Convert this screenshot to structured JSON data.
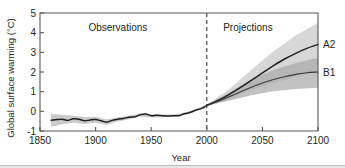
{
  "chart_data": {
    "type": "line",
    "title": "",
    "xlabel": "Year",
    "ylabel": "Global surface warming (°C)",
    "xlim": [
      1850,
      2100
    ],
    "ylim": [
      -1,
      5
    ],
    "xticks": [
      1850,
      1900,
      1950,
      2000,
      2050,
      2100
    ],
    "xtick_labels": [
      "1850",
      "1900",
      "1950",
      "2000",
      "2050",
      "2100"
    ],
    "yticks": [
      -1,
      0,
      1,
      2,
      3,
      4,
      5
    ],
    "ytick_labels": [
      "-1",
      "0",
      "1",
      "2",
      "3",
      "4",
      "5"
    ],
    "grid": false,
    "legend_position": "right-inline",
    "annotations": [
      {
        "text": "Observations",
        "x": 1920,
        "y": 4.1
      },
      {
        "text": "Projections",
        "x": 2037,
        "y": 4.1
      }
    ],
    "divider": {
      "x": 2000,
      "style": "dashed",
      "label": ""
    },
    "series": [
      {
        "name": "Observations",
        "color": "#231f20",
        "x": [
          1860,
          1865,
          1870,
          1875,
          1880,
          1885,
          1890,
          1895,
          1900,
          1905,
          1910,
          1915,
          1920,
          1925,
          1930,
          1935,
          1940,
          1945,
          1950,
          1955,
          1960,
          1965,
          1970,
          1975,
          1980,
          1985,
          1990,
          1995,
          2000
        ],
        "values": [
          -0.45,
          -0.42,
          -0.4,
          -0.46,
          -0.38,
          -0.4,
          -0.48,
          -0.44,
          -0.42,
          -0.48,
          -0.55,
          -0.46,
          -0.4,
          -0.36,
          -0.3,
          -0.28,
          -0.18,
          -0.14,
          -0.22,
          -0.2,
          -0.22,
          -0.24,
          -0.22,
          -0.22,
          -0.12,
          -0.06,
          0.06,
          0.14,
          0.3
        ]
      },
      {
        "name": "A2",
        "color": "#231f20",
        "x": [
          2000,
          2010,
          2020,
          2030,
          2040,
          2050,
          2060,
          2070,
          2080,
          2090,
          2100
        ],
        "values": [
          0.3,
          0.55,
          0.85,
          1.2,
          1.58,
          1.95,
          2.32,
          2.66,
          2.95,
          3.2,
          3.4
        ]
      },
      {
        "name": "B1",
        "color": "#3a3a3c",
        "x": [
          2000,
          2010,
          2020,
          2030,
          2040,
          2050,
          2060,
          2070,
          2080,
          2090,
          2100
        ],
        "values": [
          0.3,
          0.5,
          0.74,
          0.98,
          1.22,
          1.44,
          1.62,
          1.76,
          1.88,
          1.96,
          2.0
        ]
      }
    ],
    "bands": [
      {
        "name": "Observations uncertainty",
        "series": "Observations",
        "x": [
          1860,
          1870,
          1880,
          1890,
          1900,
          1910,
          1920,
          1930,
          1940,
          1950,
          1960,
          1970,
          1980,
          1990,
          2000
        ],
        "lower": [
          -0.78,
          -0.66,
          -0.58,
          -0.64,
          -0.58,
          -0.68,
          -0.52,
          -0.4,
          -0.28,
          -0.3,
          -0.3,
          -0.29,
          -0.19,
          -0.01,
          0.26
        ],
        "upper": [
          -0.14,
          -0.18,
          -0.22,
          -0.3,
          -0.28,
          -0.42,
          -0.3,
          -0.22,
          -0.1,
          -0.15,
          -0.16,
          -0.16,
          -0.06,
          0.12,
          0.34
        ]
      },
      {
        "name": "A2 uncertainty",
        "series": "A2",
        "x": [
          2000,
          2020,
          2040,
          2060,
          2080,
          2100
        ],
        "lower": [
          0.28,
          0.62,
          1.08,
          1.44,
          1.76,
          2.05
        ],
        "upper": [
          0.34,
          1.12,
          2.1,
          3.05,
          3.85,
          4.5
        ]
      },
      {
        "name": "B1 uncertainty",
        "series": "B1",
        "x": [
          2000,
          2020,
          2040,
          2060,
          2080,
          2100
        ],
        "lower": [
          0.28,
          0.54,
          0.82,
          1.02,
          1.14,
          1.2
        ],
        "upper": [
          0.34,
          0.96,
          1.62,
          2.1,
          2.46,
          2.72
        ]
      }
    ],
    "series_labels": [
      {
        "text": "A2",
        "value": 3.4
      },
      {
        "text": "B1",
        "value": 2.0
      }
    ]
  },
  "axes": {
    "y_title": "Global surface warming (°C)",
    "x_title": "Year",
    "ytick_0": "5",
    "ytick_1": "4",
    "ytick_2": "3",
    "ytick_3": "2",
    "ytick_4": "1",
    "ytick_5": "0",
    "ytick_6": "-1",
    "xtick_0": "1850",
    "xtick_1": "1900",
    "xtick_2": "1950",
    "xtick_3": "2000",
    "xtick_4": "2050",
    "xtick_5": "2100"
  },
  "labels": {
    "observations": "Observations",
    "projections": "Projections",
    "scenario_a2": "A2",
    "scenario_b1": "B1"
  }
}
